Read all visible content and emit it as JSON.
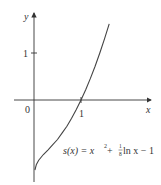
{
  "chart_data": {
    "type": "line",
    "title": "",
    "xlabel": "x",
    "ylabel": "y",
    "x_ticks": [
      "0",
      "1"
    ],
    "y_ticks": [
      "1"
    ],
    "origin_label": "0",
    "grid": false,
    "series": [
      {
        "name": "s(x) = x^2 + (1/8) ln x - 1",
        "x": [
          0.02,
          0.05,
          0.1,
          0.2,
          0.3,
          0.4,
          0.5,
          0.6,
          0.7,
          0.8,
          0.9,
          1.0,
          1.1,
          1.2,
          1.3,
          1.4,
          1.5,
          1.6
        ],
        "values": [
          -1.49,
          -1.37,
          -1.28,
          -1.16,
          -1.06,
          -0.95,
          -0.84,
          -0.7,
          -0.56,
          -0.39,
          -0.2,
          0.0,
          0.22,
          0.46,
          0.72,
          1.0,
          1.3,
          1.62
        ]
      }
    ],
    "annotations": [
      {
        "text": "s(x) = x² + ⅛ ln x − 1",
        "x": 1.2,
        "y": -1.0
      }
    ],
    "xlim": [
      -0.4,
      2.5
    ],
    "ylim": [
      -1.6,
      1.8
    ]
  },
  "labels": {
    "y_axis": "y",
    "x_axis": "x",
    "origin": "0",
    "x_tick_1": "1",
    "y_tick_1": "1",
    "formula_lhs": "s(x) = x",
    "formula_exp": "2",
    "formula_plus": " + ",
    "formula_num": "1",
    "formula_den": "8",
    "formula_rest": " ln x − 1"
  }
}
